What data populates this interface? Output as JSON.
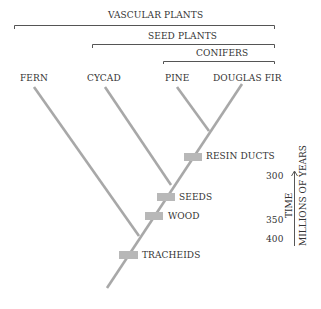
{
  "groups": {
    "vascular": "VASCULAR PLANTS",
    "seed": "SEED PLANTS",
    "conifers": "CONIFERS"
  },
  "taxa": [
    "FERN",
    "CYCAD",
    "PINE",
    "DOUGLAS FIR"
  ],
  "traits": {
    "resin": "RESIN DUCTS",
    "seeds": "SEEDS",
    "wood": "WOOD",
    "tracheids": "TRACHEIDS"
  },
  "time_axis": {
    "ticks": [
      "300",
      "350",
      "400"
    ],
    "label": "TIME",
    "units": "MILLIONS OF YEARS"
  },
  "colors": {
    "branch": "#a8a8a8",
    "trait_box": "#b8b8b8",
    "bracket": "#555555",
    "text": "#333333"
  }
}
